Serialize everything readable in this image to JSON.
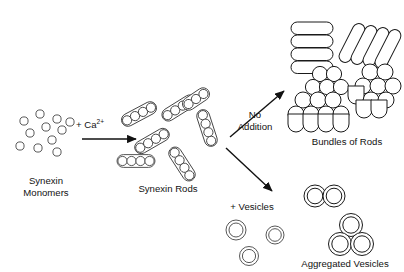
{
  "figure": {
    "background_color": "#ffffff",
    "stroke_color": "#1a1a1a",
    "text_color": "#121212",
    "width": 404,
    "height": 272
  },
  "labels": {
    "monomers": "Synexin\nMonomers",
    "monomers_line1": "Synexin",
    "monomers_line2": "Monomers",
    "calcium": "+ Ca",
    "calcium_superscript": "2+",
    "rods": "Synexin Rods",
    "no_addition_line1": "No",
    "no_addition_line2": "Addition",
    "bundles": "Bundles of Rods",
    "plus_vesicles": "+ Vesicles",
    "aggregated": "Aggregated Vesicles"
  },
  "stages": [
    {
      "id": "synexin-monomers",
      "label": "Synexin Monomers",
      "description": "Scattered open circles representing free synexin monomer protein units",
      "element_count": 11,
      "element_shape": "open-circle",
      "circle_radius": 4.1,
      "circles": [
        {
          "cx": 40,
          "cy": 114
        },
        {
          "cx": 57,
          "cy": 119
        },
        {
          "cx": 24,
          "cy": 121
        },
        {
          "cx": 70,
          "cy": 122
        },
        {
          "cx": 46,
          "cy": 127
        },
        {
          "cx": 30,
          "cy": 133
        },
        {
          "cx": 62,
          "cy": 130
        },
        {
          "cx": 52,
          "cy": 140
        },
        {
          "cx": 20,
          "cy": 146
        },
        {
          "cx": 38,
          "cy": 148
        },
        {
          "cx": 57,
          "cy": 152
        }
      ]
    },
    {
      "id": "synexin-rods",
      "label": "Synexin Rods",
      "description": "Capsule-shaped rods each containing a linear chain of circular subunits",
      "element_count": 7,
      "element_shape": "capsule-with-circle-chain",
      "rods": [
        {
          "cx": 139,
          "cy": 114,
          "angle": -28,
          "beads": 4
        },
        {
          "cx": 178,
          "cy": 107,
          "angle": -32,
          "beads": 4
        },
        {
          "cx": 206,
          "cy": 128,
          "angle": 72,
          "beads": 4
        },
        {
          "cx": 152,
          "cy": 140,
          "angle": -30,
          "beads": 4
        },
        {
          "cx": 136,
          "cy": 160,
          "angle": 0,
          "beads": 4
        },
        {
          "cx": 181,
          "cy": 163,
          "angle": 57,
          "beads": 4
        },
        {
          "cx": 195,
          "cy": 100,
          "angle": -34,
          "beads": 3
        }
      ]
    },
    {
      "id": "bundles-of-rods",
      "label": "Bundles of Rods",
      "description": "Stacked capsules in longitudinal view and hexagonally packed circles in cross-section view",
      "stacks": [
        {
          "id": "stack-horizontal",
          "cx": 311,
          "cy": 44,
          "angle": 0,
          "capsules": 4,
          "capsule_w": 42,
          "capsule_h": 12
        },
        {
          "id": "stack-diagonal",
          "cx": 368,
          "cy": 44,
          "angle": -62,
          "capsules": 4,
          "capsule_w": 42,
          "capsule_h": 12
        }
      ],
      "clusters": [
        {
          "id": "cluster-upper-left",
          "cx": 324,
          "cy": 80,
          "circles": 5,
          "radius": 7.5
        },
        {
          "id": "cluster-lower-left",
          "cx": 316,
          "cy": 106,
          "circles": 9,
          "radius": 8
        },
        {
          "id": "cluster-right",
          "cx": 370,
          "cy": 92,
          "circles": 10,
          "radius": 8
        }
      ]
    },
    {
      "id": "free-vesicles",
      "label": "+ Vesicles",
      "description": "Separate double-walled concentric circle vesicles",
      "element_count": 4,
      "element_shape": "concentric-double-circle",
      "vesicles": [
        {
          "cx": 236,
          "cy": 230,
          "r_outer": 10,
          "r_inner": 7
        },
        {
          "cx": 275,
          "cy": 235,
          "r_outer": 9,
          "r_inner": 6.3
        },
        {
          "cx": 249,
          "cy": 255,
          "r_outer": 9.5,
          "r_inner": 6.6
        }
      ]
    },
    {
      "id": "aggregated-vesicles",
      "label": "Aggregated Vesicles",
      "description": "Clusters of touching double-walled vesicles",
      "clusters": [
        {
          "id": "pair-cluster",
          "vesicles": [
            {
              "cx": 315,
              "cy": 196,
              "r_outer": 11,
              "r_inner": 7.8
            },
            {
              "cx": 334,
              "cy": 196,
              "r_outer": 11,
              "r_inner": 7.8
            }
          ]
        },
        {
          "id": "triangle-cluster",
          "vesicles": [
            {
              "cx": 351,
              "cy": 225,
              "r_outer": 11.5,
              "r_inner": 8.2
            },
            {
              "cx": 340,
              "cy": 243,
              "r_outer": 11.5,
              "r_inner": 8.2
            },
            {
              "cx": 362,
              "cy": 243,
              "r_outer": 11.5,
              "r_inner": 8.2
            }
          ]
        }
      ]
    }
  ],
  "arrows": [
    {
      "id": "arrow-calcium",
      "label": "+ Ca2+",
      "direction": "right",
      "x1": 82,
      "y1": 139,
      "x2": 136,
      "y2": 139
    },
    {
      "id": "arrow-no-addition",
      "label": "No Addition",
      "direction": "up-right",
      "x1": 230,
      "y1": 137,
      "x2": 283,
      "y2": 92
    },
    {
      "id": "arrow-plus-vesicles",
      "label": "+ Vesicles",
      "direction": "down-right",
      "x1": 225,
      "y1": 148,
      "x2": 272,
      "y2": 192
    }
  ]
}
